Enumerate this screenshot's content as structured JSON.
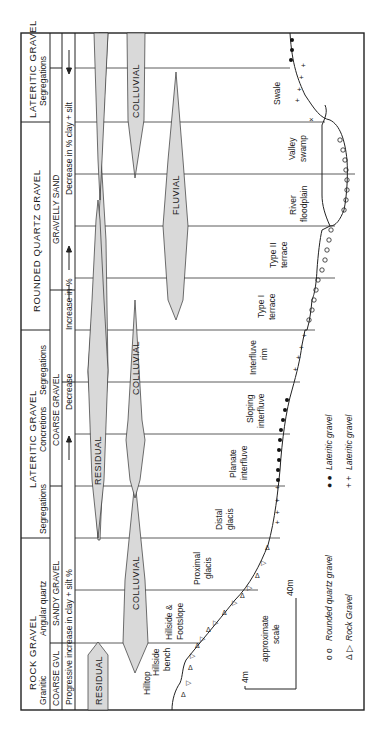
{
  "figure": {
    "orientation": "rotated 90 degrees counter-clockwise",
    "header": {
      "groups": [
        {
          "name": "ROCK GRAVEL",
          "sub_left": "Granitic",
          "sub_right": "Angular quartz"
        },
        {
          "name": "LATERITIC GRAVEL",
          "sub_left": "Segregations",
          "sub_mid": "Concretions",
          "sub_right": "Segregations"
        },
        {
          "name": "ROUNDED QUARTZ GRAVEL"
        },
        {
          "name": "LATERITIC GRAVEL",
          "sub": "Segregations"
        }
      ],
      "textures": [
        "COARSE GVL",
        "SANDY GRAVEL",
        "COARSE GRAVEL",
        "GRAVELLY SAND"
      ],
      "progression": [
        "Progressive increase in clay + silt %",
        "Decrease",
        "Increase in %",
        "Decrease in % clay + silt"
      ]
    },
    "bands": [
      {
        "label": "RESIDUAL"
      },
      {
        "label": "COLLUVIAL"
      },
      {
        "label": "RESIDUAL"
      },
      {
        "label": "COLLUVIAL"
      },
      {
        "label": "FLUVIAL"
      },
      {
        "label": "COLLUVIAL"
      }
    ],
    "landforms": [
      "Hilltop",
      "Hillside bench",
      "Hillside & Footslope",
      "Proximal glacis",
      "Distal glacis",
      "Planate interfluve",
      "Sloping interfluve",
      "Interfluve rim",
      "Type I terrace",
      "Type II terrace",
      "River floodplain",
      "Valley swamp",
      "Swale"
    ],
    "scale": {
      "vertical": "4m",
      "horizontal": "40m",
      "label": "approximate scale"
    },
    "legend": [
      {
        "symbol": "o o",
        "label": "Rounded quartz gravel"
      },
      {
        "symbol": "Δ ▷",
        "label": "Rock Gravel"
      },
      {
        "symbol": "● ●",
        "label": "Lateritic gravel"
      },
      {
        "symbol": "+ +",
        "label": "Lateritic gravel"
      }
    ]
  }
}
